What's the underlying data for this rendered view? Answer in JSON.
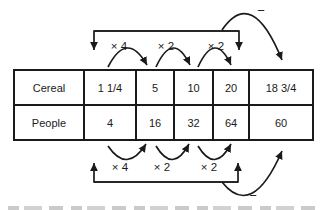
{
  "figure": {
    "table": {
      "rows": [
        {
          "label": "Cereal",
          "values": [
            "1 1/4",
            "5",
            "10",
            "20",
            "18 3/4"
          ]
        },
        {
          "label": "People",
          "values": [
            "4",
            "16",
            "32",
            "64",
            "60"
          ]
        }
      ]
    },
    "top": {
      "ops": [
        "× 4",
        "× 2",
        "× 2"
      ],
      "minus": "−"
    },
    "bottom": {
      "ops": [
        "× 4",
        "× 2",
        "× 2"
      ],
      "minus": "−"
    }
  },
  "colors": {
    "ink": "#1a1a1a",
    "background": "#ffffff"
  }
}
